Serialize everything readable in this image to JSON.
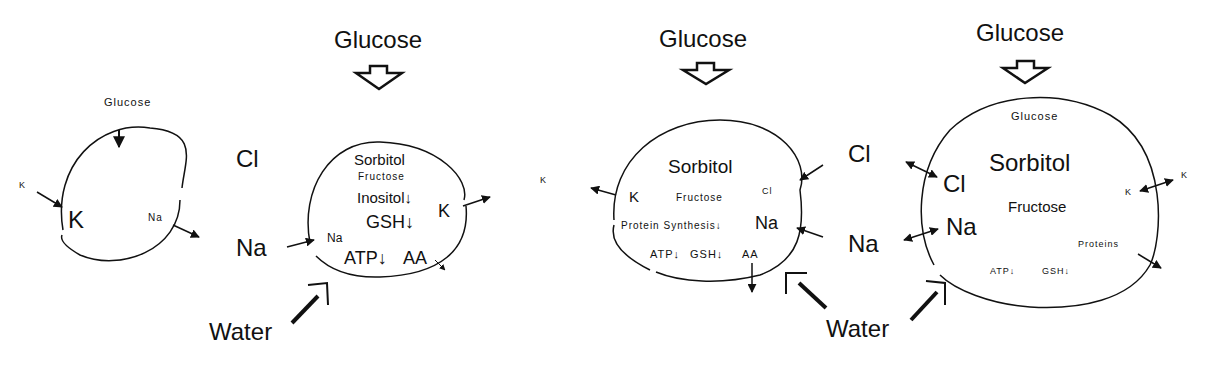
{
  "diagram": {
    "panels": [
      {
        "id": "normal-cell",
        "outside": {
          "glucose": "Glucose",
          "k": "K"
        },
        "inside": {
          "k": "K",
          "na": "Na"
        }
      },
      {
        "id": "hyperglycemic-cell-early",
        "outside": {
          "glucose": "Glucose",
          "cl": "Cl",
          "na": "Na",
          "water": "Water"
        },
        "inside": {
          "sorbitol": "Sorbitol",
          "fructose": "Fructose",
          "inositol": "Inositol↓",
          "gsh": "GSH↓",
          "k": "K",
          "na": "Na",
          "atp": "ATP↓",
          "aa": "AA"
        }
      },
      {
        "id": "hyperglycemic-cell-intermediate",
        "outside": {
          "glucose": "Glucose",
          "k": "K"
        },
        "inside": {
          "sorbitol": "Sorbitol",
          "k": "K",
          "fructose": "Fructose",
          "cl": "Cl",
          "protein_synthesis": "Protein Synthesis↓",
          "na": "Na",
          "atp": "ATP↓",
          "gsh": "GSH↓",
          "aa": "AA"
        }
      },
      {
        "id": "hyperglycemic-cell-swollen",
        "outside": {
          "glucose": "Glucose",
          "cl": "Cl",
          "na": "Na",
          "water": "Water",
          "k": "K"
        },
        "inside": {
          "glucose": "Glucose",
          "sorbitol": "Sorbitol",
          "cl": "Cl",
          "na": "Na",
          "fructose": "Fructose",
          "k": "K",
          "proteins": "Proteins",
          "atp": "ATP↓",
          "gsh": "GSH↓"
        }
      }
    ]
  }
}
